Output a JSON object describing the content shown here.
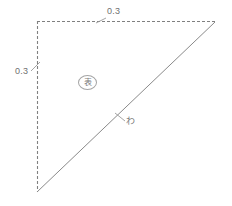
{
  "figure": {
    "background_color": "#ffffff",
    "line_color": "#808080",
    "text_color": "#6f6f6f",
    "width": 232,
    "height": 206,
    "geometry": {
      "top_left": {
        "x": 37,
        "y": 21
      },
      "top_right": {
        "x": 215,
        "y": 22
      },
      "bottom_left": {
        "x": 37,
        "y": 192
      }
    },
    "edges": {
      "top": {
        "style": "dashed",
        "dash_pattern": "3 2"
      },
      "left": {
        "style": "dashed",
        "dash_pattern": "3 2"
      },
      "diagonal": {
        "style": "solid"
      }
    },
    "dimensions": {
      "top": {
        "value": "0.3",
        "leader_from": {
          "x": 106,
          "y": 18
        },
        "leader_to": {
          "x": 97,
          "y": 22
        }
      },
      "left": {
        "value": "0.3",
        "leader_from": {
          "x": 31,
          "y": 71
        },
        "leader_to": {
          "x": 39,
          "y": 63
        }
      }
    },
    "annotations": {
      "face_marker": {
        "text": "表",
        "shape": "circle",
        "center": {
          "x": 88,
          "y": 83
        }
      },
      "fold_label": {
        "text": "わ",
        "leader_from": {
          "x": 124,
          "y": 120
        },
        "leader_to": {
          "x": 116,
          "y": 114
        }
      }
    }
  }
}
